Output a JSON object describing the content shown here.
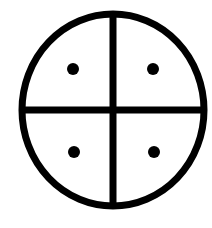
{
  "symbol": {
    "name": "quartered-circle-with-dots",
    "description": "Circle divided into four quadrants by a cross, with one dot in each quadrant",
    "colors": {
      "background": "#ffffff",
      "stroke": "#000000",
      "fill": "#000000"
    },
    "circle": {
      "cx": 113,
      "cy": 110,
      "rx": 91,
      "ry": 96,
      "stroke_width": 7
    },
    "cross": {
      "vertical": {
        "x": 113,
        "y1": 14,
        "y2": 206,
        "width": 7
      },
      "horizontal": {
        "y": 110,
        "x1": 22,
        "x2": 204,
        "width": 7
      }
    },
    "dots": [
      {
        "quadrant": "top-left",
        "cx": 73,
        "cy": 69,
        "r": 6
      },
      {
        "quadrant": "top-right",
        "cx": 153,
        "cy": 69,
        "r": 6
      },
      {
        "quadrant": "bottom-left",
        "cx": 74,
        "cy": 152,
        "r": 6
      },
      {
        "quadrant": "bottom-right",
        "cx": 154,
        "cy": 152,
        "r": 6
      }
    ]
  }
}
